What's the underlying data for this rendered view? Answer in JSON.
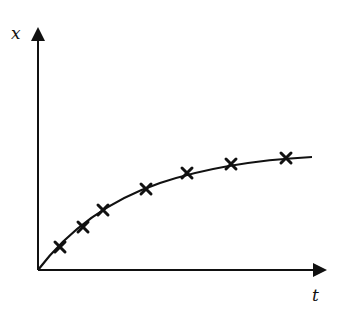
{
  "chart_data": {
    "type": "scatter",
    "title": "",
    "xlabel": "t",
    "ylabel": "x",
    "grid": false,
    "legend": null,
    "axis_ticks": false,
    "series": [
      {
        "name": "measurements",
        "marker": "x",
        "points_px": [
          [
            60,
            247
          ],
          [
            83,
            227
          ],
          [
            103,
            210
          ],
          [
            146,
            189
          ],
          [
            187,
            173
          ],
          [
            231,
            164
          ],
          [
            286,
            158
          ]
        ]
      },
      {
        "name": "fit-curve",
        "style": "line",
        "shape": "concave-increasing, approaching asymptote"
      }
    ],
    "origin_px": [
      38,
      270
    ],
    "x_axis_end_px": 325,
    "y_axis_end_px": 28
  },
  "labels": {
    "y_axis": "x",
    "x_axis": "t"
  },
  "colors": {
    "ink": "#111111",
    "background": "#ffffff"
  }
}
